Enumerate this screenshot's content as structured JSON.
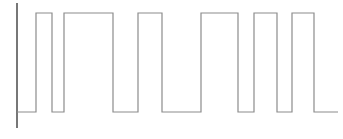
{
  "figure": {
    "width": 343,
    "height": 139,
    "background_color": "#ffffff",
    "title": "",
    "caption": ""
  },
  "axis": {
    "y_axis_visible": true,
    "x_axis_visible": false,
    "y_axis_x": 17,
    "y_axis_top": 3,
    "y_axis_bottom": 128,
    "axis_color": "#555555",
    "axis_width": 1.6,
    "tick_labels_x": [],
    "tick_labels_y": [],
    "xlabel": "",
    "ylabel": ""
  },
  "trace": {
    "color": "#8c8c8c",
    "width": 1.2,
    "style": "step-post",
    "low_y": 112,
    "high_y": 13
  },
  "chart_data": {
    "type": "line",
    "subtype": "square-wave",
    "title": "",
    "subtitle": "",
    "xlabel": "",
    "ylabel": "",
    "xlim": [
      17,
      338
    ],
    "ylim": [
      0,
      1
    ],
    "grid": false,
    "legend": null,
    "legend_position": "none",
    "tick_labels_x": [],
    "tick_labels_y": [],
    "annotations": [],
    "series": [
      {
        "name": "digital signal",
        "color": "#8c8c8c",
        "step": "post",
        "x": [
          17,
          36,
          52,
          64,
          75,
          113,
          124,
          138,
          162,
          201,
          238,
          254,
          277,
          292,
          314,
          338
        ],
        "values": [
          0,
          1,
          0,
          1,
          1,
          0,
          0,
          1,
          0,
          1,
          0,
          1,
          0,
          1,
          0,
          0
        ],
        "transitions": [
          {
            "x": 17,
            "level": 0
          },
          {
            "x": 36,
            "level": 1
          },
          {
            "x": 52,
            "level": 0
          },
          {
            "x": 64,
            "level": 1
          },
          {
            "x": 75,
            "level": 1
          },
          {
            "x": 113,
            "level": 0
          },
          {
            "x": 138,
            "level": 1
          },
          {
            "x": 162,
            "level": 0
          },
          {
            "x": 201,
            "level": 1
          },
          {
            "x": 238,
            "level": 0
          },
          {
            "x": 254,
            "level": 1
          },
          {
            "x": 277,
            "level": 0
          },
          {
            "x": 292,
            "level": 1
          },
          {
            "x": 314,
            "level": 0
          },
          {
            "x": 338,
            "level": 0
          }
        ]
      }
    ]
  }
}
